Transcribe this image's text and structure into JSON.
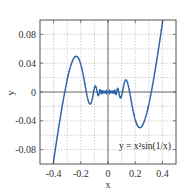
{
  "chart_data": {
    "type": "line",
    "title": "",
    "xlabel": "x",
    "ylabel": "y",
    "xlim": [
      -0.5,
      0.5
    ],
    "ylim": [
      -0.1,
      0.1
    ],
    "grid": true,
    "xticks": [
      -0.4,
      -0.2,
      0,
      0.2,
      0.4
    ],
    "xtick_labels": [
      "-0.4",
      "-0.2",
      "0",
      "0.2",
      "0.4"
    ],
    "yticks": [
      0.08,
      0.04,
      0,
      -0.04,
      -0.08
    ],
    "ytick_labels": [
      "0.08",
      "0.04",
      "0",
      "-0.04",
      "-0.08"
    ],
    "x_grid": [
      -0.4,
      -0.3,
      -0.2,
      -0.1,
      0,
      0.1,
      0.2,
      0.3,
      0.4
    ],
    "y_grid": [
      0.08,
      0.06,
      0.04,
      0.02,
      0,
      -0.02,
      -0.04,
      -0.06,
      -0.08
    ],
    "annotation": "y = x²sin(1/x)",
    "series": [
      {
        "name": "y = x²sin(1/x)",
        "function": "x^2*sin(1/x)",
        "color": "#2a62a8",
        "x_range": [
          -0.5,
          0.5
        ],
        "samples": 4000
      }
    ]
  },
  "colors": {
    "line": "#2a62a8",
    "axis": "#555555",
    "grid": "#bbbbbb",
    "frame": "#555555"
  }
}
